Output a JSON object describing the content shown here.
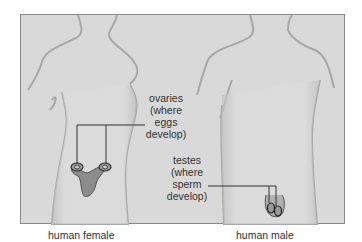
{
  "figure": {
    "panel_background": "#d9d9d9",
    "figures": [
      {
        "id": "female",
        "caption": "human female"
      },
      {
        "id": "male",
        "caption": "human male"
      }
    ],
    "annotations": {
      "ovaries": {
        "lines": [
          "ovaries",
          "(where",
          "eggs",
          "develop)"
        ]
      },
      "testes": {
        "lines": [
          "testes",
          "(where",
          "sperm",
          "develop)"
        ]
      }
    }
  }
}
